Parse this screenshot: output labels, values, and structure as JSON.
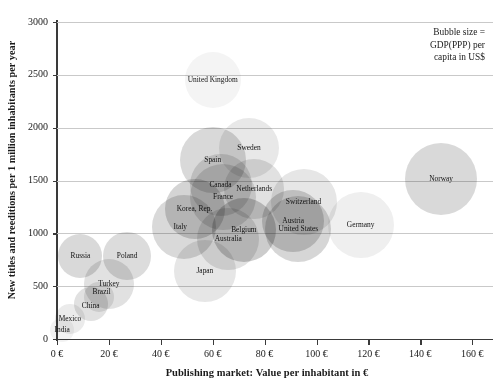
{
  "chart_data": {
    "type": "scatter",
    "title": "",
    "xlabel": "Publishing market: Value per inhabitant in €",
    "ylabel": "New titles and reeditions per 1 million inhabitants per year",
    "xlim": [
      0,
      168
    ],
    "ylim": [
      0,
      3000
    ],
    "xticks": [
      "0 €",
      "20 €",
      "40 €",
      "60 €",
      "80 €",
      "100 €",
      "120 €",
      "140 €",
      "160 €"
    ],
    "xtick_values": [
      0,
      20,
      40,
      60,
      80,
      100,
      120,
      140,
      160
    ],
    "yticks": [
      "0",
      "500",
      "1000",
      "1500",
      "2000",
      "2500",
      "3000"
    ],
    "ytick_values": [
      0,
      500,
      1000,
      1500,
      2000,
      2500,
      3000
    ],
    "grid": "horizontal",
    "legend_position": "top-right",
    "size_encoding": "Bubble size = GDP(PPP) per capita in US$",
    "points": [
      {
        "label": "India",
        "x": 2,
        "y": 90,
        "r": 12,
        "shade": 0.1,
        "lx": 0,
        "ly": 0
      },
      {
        "label": "Mexico",
        "x": 5,
        "y": 190,
        "r": 15,
        "shade": 0.16,
        "lx": 0,
        "ly": 0
      },
      {
        "label": "China",
        "x": 13,
        "y": 330,
        "r": 17,
        "shade": 0.24,
        "lx": 0,
        "ly": 2
      },
      {
        "label": "Brazil",
        "x": 16,
        "y": 395,
        "r": 15,
        "shade": 0.2,
        "lx": 3,
        "ly": -5
      },
      {
        "label": "Russia",
        "x": 9,
        "y": 790,
        "r": 22,
        "shade": 0.3,
        "lx": 0,
        "ly": 0
      },
      {
        "label": "Turkey",
        "x": 20,
        "y": 520,
        "r": 25,
        "shade": 0.24,
        "lx": 0,
        "ly": 0
      },
      {
        "label": "Poland",
        "x": 27,
        "y": 790,
        "r": 24,
        "shade": 0.28,
        "lx": 0,
        "ly": 0
      },
      {
        "label": "Italy",
        "x": 49,
        "y": 1060,
        "r": 32,
        "shade": 0.3,
        "lx": -4,
        "ly": 0
      },
      {
        "label": "Korea, Rep.",
        "x": 53,
        "y": 1230,
        "r": 30,
        "shade": 0.34,
        "lx": 0,
        "ly": 0
      },
      {
        "label": "Japan",
        "x": 57,
        "y": 640,
        "r": 31,
        "shade": 0.2,
        "lx": 0,
        "ly": 0
      },
      {
        "label": "Spain",
        "x": 60,
        "y": 1690,
        "r": 33,
        "shade": 0.3,
        "lx": 0,
        "ly": 0
      },
      {
        "label": "Canada",
        "x": 63,
        "y": 1460,
        "r": 31,
        "shade": 0.26,
        "lx": 0,
        "ly": 0
      },
      {
        "label": "France",
        "x": 64,
        "y": 1340,
        "r": 33,
        "shade": 0.26,
        "lx": 0,
        "ly": 0
      },
      {
        "label": "Australia",
        "x": 66,
        "y": 945,
        "r": 31,
        "shade": 0.24,
        "lx": 0,
        "ly": 0
      },
      {
        "label": "Belgium",
        "x": 72,
        "y": 1030,
        "r": 32,
        "shade": 0.4,
        "lx": 0,
        "ly": 0
      },
      {
        "label": "Sweden",
        "x": 74,
        "y": 1810,
        "r": 30,
        "shade": 0.18,
        "lx": 0,
        "ly": 0
      },
      {
        "label": "Netherlands",
        "x": 76,
        "y": 1420,
        "r": 30,
        "shade": 0.24,
        "lx": 0,
        "ly": 0
      },
      {
        "label": "United Kingdom",
        "x": 60,
        "y": 2450,
        "r": 28,
        "shade": 0.09,
        "lx": 0,
        "ly": 0
      },
      {
        "label": "Austria",
        "x": 91,
        "y": 1120,
        "r": 31,
        "shade": 0.34,
        "lx": 0,
        "ly": 0
      },
      {
        "label": "United States",
        "x": 93,
        "y": 1040,
        "r": 33,
        "shade": 0.32,
        "lx": 0,
        "ly": 0
      },
      {
        "label": "Switzerland",
        "x": 95,
        "y": 1300,
        "r": 33,
        "shade": 0.2,
        "lx": 0,
        "ly": 0
      },
      {
        "label": "Germany",
        "x": 117,
        "y": 1075,
        "r": 33,
        "shade": 0.13,
        "lx": 0,
        "ly": 0
      },
      {
        "label": "Norway",
        "x": 148,
        "y": 1510,
        "r": 36,
        "shade": 0.3,
        "lx": 0,
        "ly": 0
      }
    ]
  },
  "legend": {
    "line1": "Bubble size =",
    "line2": "GDP(PPP) per",
    "line3": "capita in US$"
  }
}
